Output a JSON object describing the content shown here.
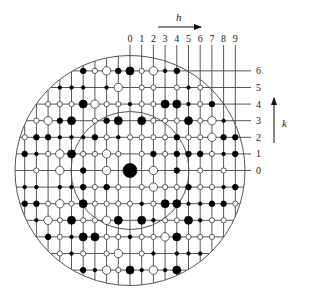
{
  "figure": {
    "h_axis": {
      "label": "h",
      "ticks": [
        "0",
        "1",
        "2",
        "3",
        "4",
        "5",
        "6",
        "7",
        "8",
        "9"
      ]
    },
    "k_axis": {
      "label": "k",
      "ticks": [
        "0",
        "1",
        "2",
        "3",
        "4",
        "5",
        "6"
      ]
    },
    "geometry": {
      "origin_x": 130,
      "origin_y": 170.5,
      "dx": 11.7,
      "dy": 16.6,
      "outer_radius": 115,
      "inner_radius": 59,
      "h_range": [
        -9,
        9
      ],
      "k_range": [
        -6,
        6
      ]
    },
    "legend_note": "Filled dots = strong reflections, open circles = weak reflections; size indicates intensity",
    "rows": [
      {
        "k": 6,
        "spots": {
          "-4": "F2",
          "-3": "O2",
          "-2": "O3",
          "-1": "F2",
          "0": "F3",
          "1": "O2",
          "2": "O3",
          "3": "F1",
          "4": "F2"
        }
      },
      {
        "k": 5,
        "spots": {
          "-6": "F1",
          "-5": "F1",
          "-4": "F1",
          "-2": "F1",
          "-1": "O3",
          "1": "O2",
          "2": "O2",
          "4": "O2",
          "5": "F1",
          "6": "O2"
        }
      },
      {
        "k": 4,
        "spots": {
          "-7": "O2",
          "-6": "O2",
          "-5": "O2",
          "-4": "F3",
          "-3": "O3",
          "-2": "O2",
          "-1": "O2",
          "0": "F1",
          "1": "O2",
          "2": "O2",
          "3": "F3",
          "4": "F3",
          "5": "F1",
          "6": "O2",
          "7": "F2"
        }
      },
      {
        "k": 3,
        "spots": {
          "-8": "O2",
          "-7": "O3",
          "-6": "F2",
          "-5": "F3",
          "-3": "O2",
          "-2": "F2",
          "-1": "F3",
          "1": "F3",
          "2": "O2",
          "3": "O2",
          "4": "O2",
          "5": "F3",
          "6": "O2",
          "7": "O3",
          "8": "F1"
        }
      },
      {
        "k": 2,
        "spots": {
          "-9": "O2",
          "-8": "F2",
          "-7": "F2",
          "-6": "F1",
          "-5": "F1",
          "-4": "F1",
          "-3": "F2",
          "-2": "O2",
          "-1": "F1",
          "0": "O2",
          "1": "O2",
          "2": "O2",
          "3": "O2",
          "4": "F2",
          "5": "O2",
          "6": "O2",
          "7": "O3",
          "8": "F2",
          "9": "F2"
        }
      },
      {
        "k": 1,
        "spots": {
          "-9": "F2",
          "-8": "F1",
          "-7": "O2",
          "-6": "O3",
          "-5": "F3",
          "-4": "O2",
          "-3": "O2",
          "-2": "O3",
          "-1": "O2",
          "1": "O2",
          "2": "F2",
          "3": "O2",
          "4": "F2",
          "5": "F2",
          "6": "F2",
          "7": "O2",
          "8": "F1",
          "9": "F2"
        }
      },
      {
        "k": 0,
        "spots": {
          "-8": "O2",
          "-6": "O3",
          "-4": "F2",
          "-2": "O3",
          "0": "X",
          "2": "O3",
          "4": "F2",
          "6": "O2",
          "8": "O2"
        }
      },
      {
        "k": -1,
        "spots": {
          "-9": "F1",
          "-8": "F1",
          "-6": "F1",
          "-5": "F1",
          "-4": "F2",
          "-3": "O2",
          "-2": "F2",
          "-1": "O2",
          "1": "O2",
          "2": "O3",
          "3": "O2",
          "4": "O2",
          "5": "F2",
          "6": "O2",
          "7": "O2",
          "8": "F1",
          "9": "F2"
        }
      },
      {
        "k": -2,
        "spots": {
          "-9": "F2",
          "-8": "F2",
          "-7": "O2",
          "-6": "O3",
          "-5": "O2",
          "-4": "F3",
          "-3": "O2",
          "-2": "O2",
          "-1": "O2",
          "0": "O2",
          "1": "F1",
          "2": "O2",
          "3": "F3",
          "4": "F3",
          "5": "F1",
          "6": "F1",
          "7": "F2",
          "8": "F2",
          "9": "O2"
        }
      },
      {
        "k": -3,
        "spots": {
          "-8": "F1",
          "-7": "O3",
          "-6": "O2",
          "-5": "F3",
          "-4": "O2",
          "-3": "O2",
          "-2": "O3",
          "-1": "F3",
          "1": "F3",
          "2": "F1",
          "3": "O2",
          "4": "O2",
          "5": "F3",
          "6": "F1",
          "7": "O2",
          "8": "O2"
        }
      },
      {
        "k": -4,
        "spots": {
          "-7": "F2",
          "-6": "O2",
          "-5": "F1",
          "-4": "F3",
          "-3": "F3",
          "-2": "O2",
          "-1": "O2",
          "0": "F1",
          "1": "O2",
          "2": "O2",
          "3": "O3",
          "4": "F3",
          "5": "O2",
          "6": "O2",
          "7": "O2"
        }
      },
      {
        "k": -5,
        "spots": {
          "-6": "O2",
          "-5": "F1",
          "-4": "O2",
          "-2": "O2",
          "-1": "O3",
          "1": "O2",
          "2": "F1",
          "4": "F1",
          "5": "F1",
          "6": "F1"
        }
      },
      {
        "k": -6,
        "spots": {
          "-4": "F2",
          "-3": "F1",
          "-2": "O3",
          "-1": "O2",
          "0": "F3",
          "1": "F1",
          "2": "O3",
          "3": "F1",
          "4": "F3"
        }
      }
    ]
  }
}
